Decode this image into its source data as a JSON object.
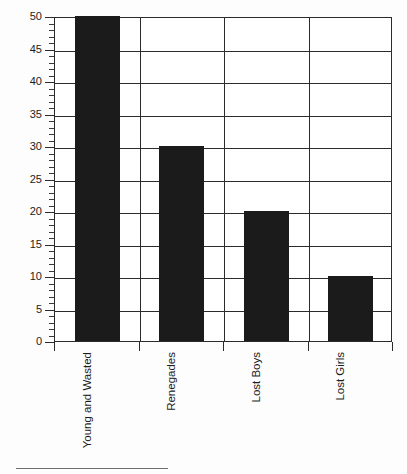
{
  "document": {
    "clipped_title": "",
    "background_color": "#fdfdfd",
    "rule_color": "#6e6e6e"
  },
  "chart_data": {
    "type": "bar",
    "title": "",
    "subtitle": "",
    "xlabel": "",
    "ylabel": "",
    "categories": [
      "Young and Wasted",
      "Renegades",
      "Lost Boys",
      "Lost Girls"
    ],
    "values": [
      50,
      30,
      20,
      10
    ],
    "series": [
      {
        "name": "",
        "values": [
          50,
          30,
          20,
          10
        ]
      }
    ],
    "ylim": [
      0,
      50
    ],
    "y_major_step": 5,
    "y_minor_step": 1,
    "y_tick_labels": [
      "0",
      "5",
      "10",
      "15",
      "20",
      "25",
      "30",
      "35",
      "40",
      "45",
      "50"
    ],
    "grid": true,
    "grid_horizontal": true,
    "grid_vertical": true,
    "legend": false,
    "legend_position": "none",
    "orientation": "vertical",
    "xtick_label_rotation": 90,
    "bar_color": "#1b1b1b",
    "axis_color": "#2b2b2b",
    "plot_background": "#ffffff",
    "annotations": []
  }
}
